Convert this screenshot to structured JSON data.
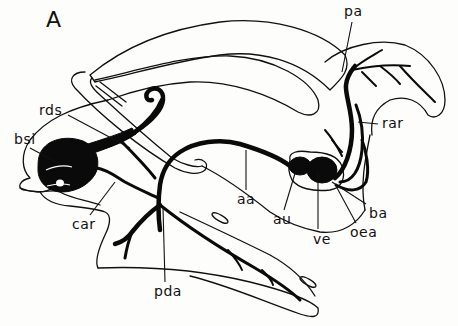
{
  "figure": {
    "panel_letter": "A",
    "colors": {
      "ink": "#0a0a0a",
      "paper": "#fdfdfb"
    },
    "labels": [
      {
        "id": "pa",
        "text": "pa",
        "x": 344,
        "y": 4
      },
      {
        "id": "rar",
        "text": "rar",
        "x": 382,
        "y": 116
      },
      {
        "id": "rds",
        "text": "rds",
        "x": 39,
        "y": 103
      },
      {
        "id": "bsi",
        "text": "bsi",
        "x": 14,
        "y": 132
      },
      {
        "id": "car",
        "text": "car",
        "x": 72,
        "y": 217
      },
      {
        "id": "aa",
        "text": "aa",
        "x": 237,
        "y": 192
      },
      {
        "id": "au",
        "text": "au",
        "x": 273,
        "y": 212
      },
      {
        "id": "ve",
        "text": "ve",
        "x": 313,
        "y": 232
      },
      {
        "id": "ba",
        "text": "ba",
        "x": 369,
        "y": 206
      },
      {
        "id": "oea",
        "text": "oea",
        "x": 350,
        "y": 225
      },
      {
        "id": "pda",
        "text": "pda",
        "x": 154,
        "y": 284
      }
    ]
  }
}
